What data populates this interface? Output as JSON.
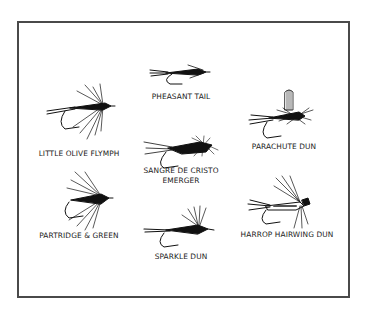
{
  "diagram": {
    "kind": "fly-pattern-plate",
    "flies": [
      {
        "id": "pheasant-tail",
        "name": "PHEASANT TAIL"
      },
      {
        "id": "little-olive-flymph",
        "name": "LITTLE OLIVE FLYMPH"
      },
      {
        "id": "parachute-dun",
        "name": "PARACHUTE DUN"
      },
      {
        "id": "sangre-de-cristo-emerger",
        "name_line1": "SANGRE DE CRISTO",
        "name_line2": "EMERGER"
      },
      {
        "id": "partridge-green",
        "name": "PARTRIDGE & GREEN"
      },
      {
        "id": "sparkle-dun",
        "name": "SPARKLE DUN"
      },
      {
        "id": "harrop-hairwing-dun",
        "name": "HARROP HAIRWING DUN"
      }
    ]
  }
}
